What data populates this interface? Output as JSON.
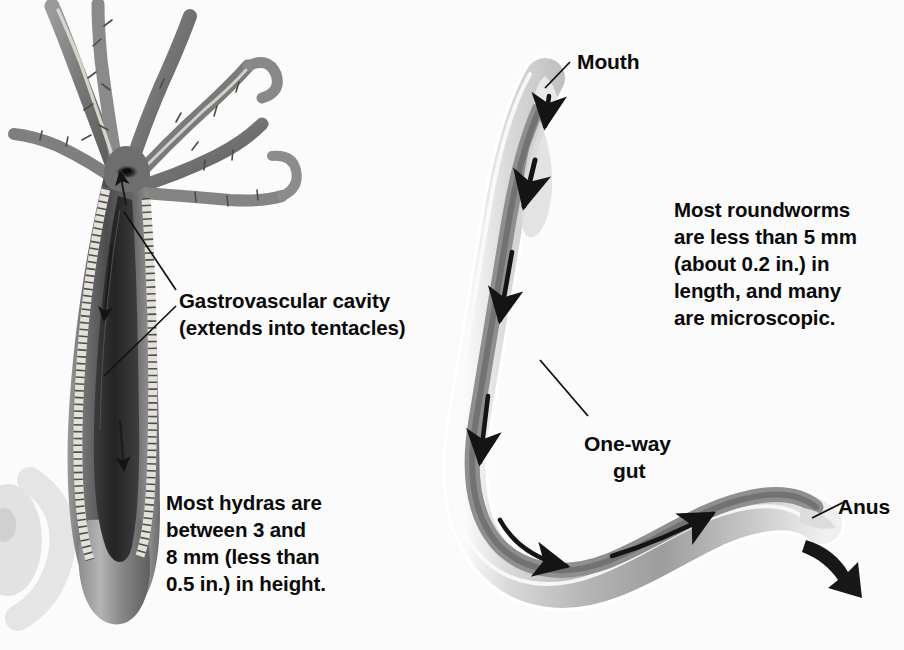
{
  "figure": {
    "background_color": "#fbfbfb",
    "text_color": "#0a0a0a",
    "organisms": [
      "hydra",
      "roundworm"
    ]
  },
  "hydra": {
    "name": "hydra",
    "label_cavity_line1": "Gastrovascular cavity",
    "label_cavity_line2": "(extends into tentacles)",
    "size_note_line1": "Most hydras are",
    "size_note_line2": "between 3 and",
    "size_note_line3": "8 mm (less than",
    "size_note_line4": "0.5 in.) in height.",
    "tentacle_count": 7,
    "colors": {
      "body_outer": "#8d8d8d",
      "body_dark": "#3a3a3a",
      "cavity": "#2e2e2e",
      "lining": "#e2e0da",
      "tentacle": "#7e7e7e"
    }
  },
  "roundworm": {
    "name": "roundworm",
    "label_mouth": "Mouth",
    "label_gut_line1": "One-way",
    "label_gut_line2": "gut",
    "label_anus": "Anus",
    "size_note_line1": "Most roundworms",
    "size_note_line2": "are less than 5 mm",
    "size_note_line3": "(about 0.2 in.) in",
    "size_note_line4": "length, and many",
    "size_note_line5": "are microscopic.",
    "colors": {
      "cuticle": "#cfcfcf",
      "body_mid": "#a9a9a9",
      "gut_dark": "#6e6e6e",
      "highlight": "#f2f2f2",
      "arrow": "#141414"
    }
  }
}
